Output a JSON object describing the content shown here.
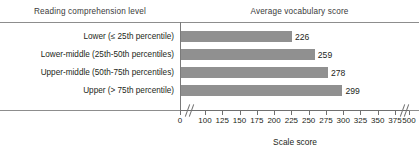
{
  "headers": {
    "left": "Reading comprehension level",
    "right": "Average vocabulary score"
  },
  "axis_title": "Scale score",
  "colors": {
    "bar": "#909090",
    "rule": "#8d8d8d",
    "text": "#231f20"
  },
  "chart_data": {
    "type": "bar",
    "orientation": "horizontal",
    "title": "Average vocabulary score",
    "xlabel": "Scale score",
    "ylabel": "Reading comprehension level",
    "categories": [
      "Lower (≤ 25th percentile)",
      "Lower-middle (25th-50th percentiles)",
      "Upper-middle (50th-75th percentiles)",
      "Upper (> 75th percentile)"
    ],
    "values": [
      226,
      259,
      278,
      299
    ],
    "value_labels": [
      "226",
      "259",
      "278",
      "299"
    ],
    "xlim": [
      0,
      500
    ],
    "ticks": [
      0,
      100,
      125,
      150,
      175,
      200,
      225,
      250,
      275,
      300,
      325,
      350,
      375,
      500
    ],
    "tick_labels": [
      "0",
      "100",
      "125",
      "150",
      "175",
      "200",
      "225",
      "250",
      "275",
      "300",
      "325",
      "350",
      "375",
      "500"
    ],
    "axis_breaks": [
      {
        "between": [
          0,
          100
        ]
      },
      {
        "between": [
          375,
          500
        ]
      }
    ],
    "grid": false,
    "legend": false
  }
}
